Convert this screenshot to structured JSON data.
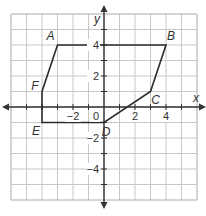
{
  "figure": {
    "title": "",
    "axes": {
      "x_label": "x",
      "y_label": "y",
      "x_range": [
        -6,
        6
      ],
      "y_range": [
        -6,
        6
      ],
      "x_ticks": [
        {
          "value": -2,
          "label": "−2"
        },
        {
          "value": 2,
          "label": "2"
        },
        {
          "value": 4,
          "label": "4"
        }
      ],
      "y_ticks": [
        {
          "value": 4,
          "label": "4"
        },
        {
          "value": 2,
          "label": "2"
        },
        {
          "value": -2,
          "label": "−2"
        },
        {
          "value": -4,
          "label": "−4"
        }
      ],
      "origin_label": "0"
    },
    "polygon": {
      "vertices": [
        {
          "name": "A",
          "x": -3,
          "y": 4
        },
        {
          "name": "B",
          "x": 4,
          "y": 4
        },
        {
          "name": "C",
          "x": 3,
          "y": 1
        },
        {
          "name": "D",
          "x": 0,
          "y": -1
        },
        {
          "name": "E",
          "x": -4,
          "y": -1
        },
        {
          "name": "F",
          "x": -4,
          "y": 1
        }
      ]
    },
    "colors": {
      "grid": "#c8c8c8",
      "axis": "#333333",
      "polygon": "#2b2b2b",
      "border": "#aaaaaa"
    }
  }
}
